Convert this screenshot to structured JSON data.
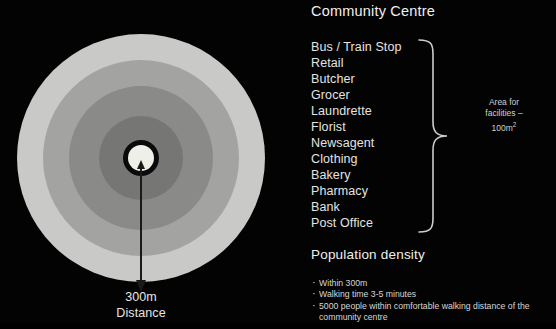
{
  "slide": {
    "background_color": "#030303",
    "title": "Community Centre"
  },
  "diagram": {
    "name": "concentric-catchment-rings",
    "distance_value": "300m",
    "distance_caption": "Distance",
    "arrow_label": "arrow-down-icon",
    "rings": [
      {
        "label": "outer-ring",
        "color": "#c9c9c7"
      },
      {
        "label": "third-ring",
        "color": "#a3a3a1"
      },
      {
        "label": "second-ring",
        "color": "#8a8a88"
      },
      {
        "label": "inner-ring",
        "color": "#767674"
      },
      {
        "label": "core-outline",
        "color": "#0a0a0a"
      },
      {
        "label": "core-centre",
        "color": "#efefe9"
      }
    ]
  },
  "facilities": {
    "items": [
      "Bus / Train Stop",
      "Retail",
      "Butcher",
      "Grocer",
      "Laundrette",
      "Florist",
      "Newsagent",
      "Clothing",
      "Bakery",
      "Pharmacy",
      "Bank",
      "Post Office"
    ],
    "brace_note_line1": "Area for",
    "brace_note_line2": "facilities –",
    "brace_note_line3": "100m",
    "brace_note_sup": "2"
  },
  "population": {
    "title": "Population density",
    "bullets": [
      "Within 300m",
      "Walking time 3-5 minutes",
      "5000 people within comfortable walking distance of the community centre"
    ]
  }
}
